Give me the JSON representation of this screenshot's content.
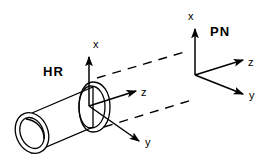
{
  "figure": {
    "title": "",
    "background_color": "#ffffff",
    "stroke_color": "#000000",
    "width": 272,
    "height": 167
  },
  "frames": [
    {
      "id": "hr",
      "label": "HR",
      "label_position": {
        "x": 43,
        "y": 76
      },
      "origin": {
        "x": 89,
        "y": 106
      },
      "axes": [
        {
          "name": "x",
          "label": "x",
          "direction": "up",
          "label_position": {
            "x": 93,
            "y": 48
          }
        },
        {
          "name": "z",
          "label": "z",
          "direction": "up-right",
          "label_position": {
            "x": 141,
            "y": 96
          }
        },
        {
          "name": "y",
          "label": "y",
          "direction": "down-right",
          "label_position": {
            "x": 145,
            "y": 146
          }
        }
      ]
    },
    {
      "id": "pn",
      "label": "PN",
      "label_position": {
        "x": 210,
        "y": 36
      },
      "origin": {
        "x": 195,
        "y": 75
      },
      "axes": [
        {
          "name": "x",
          "label": "x",
          "direction": "up",
          "label_position": {
            "x": 188,
            "y": 20
          }
        },
        {
          "name": "z",
          "label": "z",
          "direction": "up-right",
          "label_position": {
            "x": 248,
            "y": 66
          }
        },
        {
          "name": "y",
          "label": "y",
          "direction": "down-right",
          "label_position": {
            "x": 249,
            "y": 99
          }
        }
      ]
    }
  ],
  "objects": [
    {
      "name": "cylinder-pipe",
      "description": "hollow cylindrical pipe with flange at right end",
      "left_end_center": {
        "x": 32,
        "y": 133
      },
      "right_end_center": {
        "x": 93,
        "y": 107
      }
    }
  ],
  "projection_lines": [
    {
      "name": "upper-dashed-projection",
      "from": {
        "x": 97,
        "y": 78
      },
      "to": {
        "x": 188,
        "y": 51
      }
    },
    {
      "name": "lower-dashed-projection",
      "from": {
        "x": 104,
        "y": 127
      },
      "to": {
        "x": 192,
        "y": 100
      }
    }
  ],
  "icons": {
    "arrowhead": "arrowhead-icon"
  }
}
